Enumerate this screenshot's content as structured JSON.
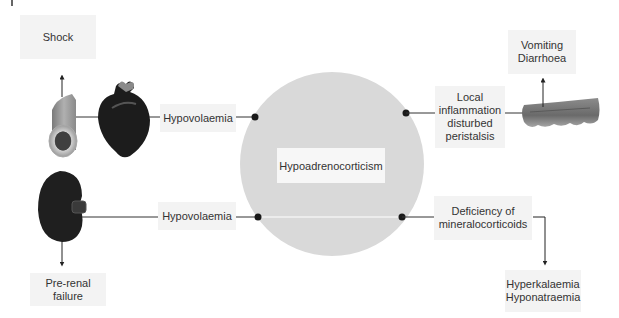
{
  "diagram": {
    "center": {
      "label": "Hypoadrenocorticism",
      "circle_color": "#d9d9d9"
    },
    "left_top": {
      "cause_label": "Hypovolaemia",
      "organs": [
        "blood-vessel",
        "heart"
      ],
      "outcome_label": "Shock"
    },
    "left_bottom": {
      "cause_label": "Hypovolaemia",
      "organs": [
        "kidney"
      ],
      "outcome_label": "Pre-renal failure"
    },
    "right_top": {
      "cause_label": "Local\ninflammation\ndisturbed\nperistalsis",
      "organs": [
        "intestine"
      ],
      "outcome_label": "Vomiting\nDiarrhoea"
    },
    "right_bottom": {
      "cause_label": "Deficiency of\nmineralocorticoids",
      "outcome_label": "Hyperkalaemia\nHyponatraemia"
    },
    "colors": {
      "line": "#333333",
      "dot": "#1a1a1a",
      "label_bg": "#f3f3f3",
      "organ_dark": "#1c1c1c",
      "organ_mid": "#6e6e6e"
    }
  }
}
